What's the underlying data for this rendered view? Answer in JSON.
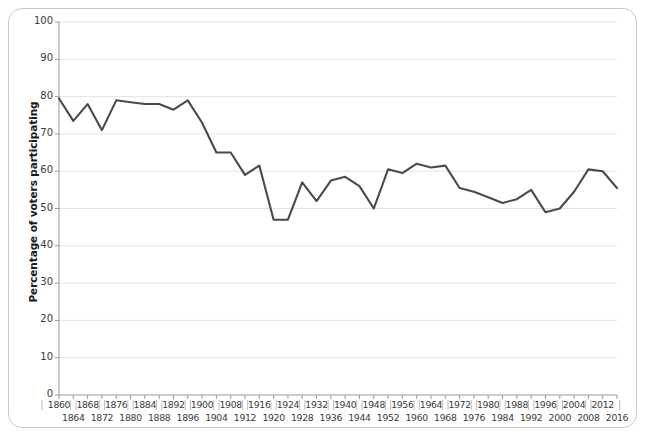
{
  "chart_data": {
    "type": "line",
    "title": "",
    "xlabel": "",
    "ylabel": "Percentage of voters participating",
    "xlim": [
      1860,
      2016
    ],
    "ylim": [
      0,
      100
    ],
    "grid": true,
    "legend": "none",
    "line_color": "#4a4a4a",
    "gridline_color": "#e3e3e3",
    "axis_color": "#9a9a9a",
    "frame_color": "#c9c9c9",
    "y_ticks": [
      0,
      10,
      20,
      30,
      40,
      50,
      60,
      70,
      80,
      90,
      100
    ],
    "x_ticks": [
      1860,
      1864,
      1868,
      1872,
      1876,
      1880,
      1884,
      1888,
      1892,
      1896,
      1900,
      1904,
      1908,
      1912,
      1916,
      1920,
      1924,
      1928,
      1932,
      1936,
      1940,
      1944,
      1948,
      1952,
      1956,
      1960,
      1964,
      1968,
      1972,
      1976,
      1980,
      1984,
      1988,
      1992,
      1996,
      2000,
      2004,
      2008,
      2012,
      2016
    ],
    "x_ticks_row_upper": [
      1860,
      1868,
      1876,
      1884,
      1892,
      1900,
      1908,
      1916,
      1924,
      1932,
      1940,
      1948,
      1956,
      1964,
      1972,
      1980,
      1988,
      1996,
      2004,
      2012
    ],
    "x_ticks_row_lower": [
      1864,
      1872,
      1880,
      1888,
      1896,
      1904,
      1912,
      1920,
      1928,
      1936,
      1944,
      1952,
      1960,
      1968,
      1976,
      1984,
      1992,
      2000,
      2008,
      2016
    ],
    "x": [
      1860,
      1864,
      1868,
      1872,
      1876,
      1880,
      1884,
      1888,
      1892,
      1896,
      1900,
      1904,
      1908,
      1912,
      1916,
      1920,
      1924,
      1928,
      1932,
      1936,
      1940,
      1944,
      1948,
      1952,
      1956,
      1960,
      1964,
      1968,
      1972,
      1976,
      1980,
      1984,
      1988,
      1992,
      1996,
      2000,
      2004,
      2008,
      2012,
      2016
    ],
    "values": [
      79.4,
      73.8,
      78.1,
      71.3,
      81.8,
      79.4,
      77.9,
      79.3,
      74.7,
      79.3,
      73.2,
      65.2,
      65.4,
      58.8,
      61.6,
      49.2,
      48.9,
      56.9,
      56.9,
      61.0,
      62.5,
      55.9,
      53.0,
      63.3,
      60.2,
      63.8,
      62.8,
      61.9,
      55.2,
      53.5,
      52.6,
      53.1,
      50.1,
      55.2,
      49.0,
      51.2,
      56.7,
      58.2,
      54.9,
      55.7
    ],
    "values_plot": [
      79.5,
      73.5,
      78.0,
      71.0,
      79.0,
      78.5,
      78.0,
      78.0,
      76.5,
      79.0,
      73.0,
      65.0,
      65.0,
      59.0,
      61.5,
      47.0,
      47.0,
      57.0,
      52.0,
      57.5,
      58.5,
      56.0,
      50.0,
      60.5,
      59.5,
      62.0,
      61.0,
      61.5,
      55.5,
      54.5,
      53.0,
      51.5,
      52.5,
      55.0,
      49.0,
      50.0,
      54.5,
      60.5,
      60.0,
      55.5
    ]
  },
  "axis": {
    "y_label_text": "Percentage of voters participating"
  }
}
